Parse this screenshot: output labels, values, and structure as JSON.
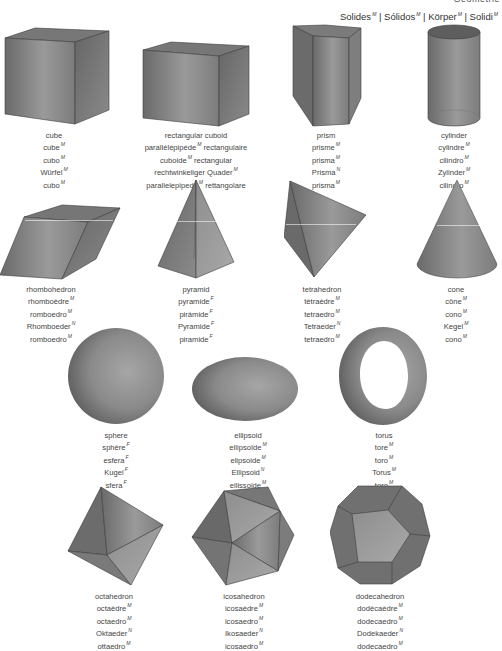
{
  "header": {
    "clipped_text": "Geometrie",
    "section_title": [
      {
        "word": "Solides",
        "gender": "M"
      },
      {
        "word": "Sólidos",
        "gender": "M"
      },
      {
        "word": "Körper",
        "gender": "M"
      },
      {
        "word": "Solidi",
        "gender": "M"
      }
    ],
    "separator": "|"
  },
  "colors": {
    "shape_fill_dark": "#6e6e6e",
    "shape_fill_light": "#a9a9a9",
    "edge": "#3c3c3c",
    "text": "#444444"
  },
  "solids": [
    {
      "id": "cube",
      "icon": "cube-icon",
      "names": [
        {
          "t": "cube",
          "g": ""
        },
        {
          "t": "cube",
          "g": "M"
        },
        {
          "t": "cubo",
          "g": "M"
        },
        {
          "t": "Würfel",
          "g": "M"
        },
        {
          "t": "cubo",
          "g": "M"
        }
      ]
    },
    {
      "id": "rectangular-cuboid",
      "icon": "cuboid-icon",
      "names": [
        {
          "t": "rectangular cuboid",
          "g": ""
        },
        {
          "t": "parallélépipède",
          "g": "M",
          "tail": " rectangulaire"
        },
        {
          "t": "cuboide",
          "g": "M",
          "tail": " rectangular"
        },
        {
          "t": "rechtwinkeliger Quader",
          "g": "M"
        },
        {
          "t": "parallelepipedo",
          "g": "M",
          "tail": " rettangolare"
        }
      ]
    },
    {
      "id": "prism",
      "icon": "prism-icon",
      "names": [
        {
          "t": "prism",
          "g": ""
        },
        {
          "t": "prisme",
          "g": "M"
        },
        {
          "t": "prisma",
          "g": "M"
        },
        {
          "t": "Prisma",
          "g": "N"
        },
        {
          "t": "prisma",
          "g": "M"
        }
      ]
    },
    {
      "id": "cylinder",
      "icon": "cylinder-icon",
      "names": [
        {
          "t": "cylinder",
          "g": ""
        },
        {
          "t": "cylindre",
          "g": "M"
        },
        {
          "t": "cilindro",
          "g": "M"
        },
        {
          "t": "Zylinder",
          "g": "M"
        },
        {
          "t": "cilindro",
          "g": "M"
        }
      ]
    },
    {
      "id": "rhombohedron",
      "icon": "rhombohedron-icon",
      "names": [
        {
          "t": "rhombohedron",
          "g": ""
        },
        {
          "t": "rhomboèdre",
          "g": "M"
        },
        {
          "t": "romboedro",
          "g": "M"
        },
        {
          "t": "Rhomboeder",
          "g": "N"
        },
        {
          "t": "romboedro",
          "g": "M"
        }
      ]
    },
    {
      "id": "pyramid",
      "icon": "pyramid-icon",
      "names": [
        {
          "t": "pyramid",
          "g": ""
        },
        {
          "t": "pyramide",
          "g": "F"
        },
        {
          "t": "pirámide",
          "g": "F"
        },
        {
          "t": "Pyramide",
          "g": "F"
        },
        {
          "t": "piramide",
          "g": "F"
        }
      ]
    },
    {
      "id": "tetrahedron",
      "icon": "tetrahedron-icon",
      "names": [
        {
          "t": "tetrahedron",
          "g": ""
        },
        {
          "t": "tétraèdre",
          "g": "M"
        },
        {
          "t": "tetraedro",
          "g": "M"
        },
        {
          "t": "Tetraeder",
          "g": "N"
        },
        {
          "t": "tetraedro",
          "g": "M"
        }
      ]
    },
    {
      "id": "cone",
      "icon": "cone-icon",
      "names": [
        {
          "t": "cone",
          "g": ""
        },
        {
          "t": "cône",
          "g": "M"
        },
        {
          "t": "cono",
          "g": "M"
        },
        {
          "t": "Kegel",
          "g": "M"
        },
        {
          "t": "cono",
          "g": "M"
        }
      ]
    },
    {
      "id": "sphere",
      "icon": "sphere-icon",
      "names": [
        {
          "t": "sphere",
          "g": ""
        },
        {
          "t": "sphère",
          "g": "F"
        },
        {
          "t": "esfera",
          "g": "F"
        },
        {
          "t": "Kugel",
          "g": "F"
        },
        {
          "t": "sfera",
          "g": "F"
        }
      ]
    },
    {
      "id": "ellipsoid",
      "icon": "ellipsoid-icon",
      "names": [
        {
          "t": "ellipsoid",
          "g": ""
        },
        {
          "t": "ellipsoïde",
          "g": "M"
        },
        {
          "t": "elipsoide",
          "g": "M"
        },
        {
          "t": "Ellipsoid",
          "g": "N"
        },
        {
          "t": "ellissoide",
          "g": "M"
        }
      ]
    },
    {
      "id": "torus",
      "icon": "torus-icon",
      "names": [
        {
          "t": "torus",
          "g": ""
        },
        {
          "t": "tore",
          "g": "M"
        },
        {
          "t": "toro",
          "g": "M"
        },
        {
          "t": "Torus",
          "g": "M"
        },
        {
          "t": "toro",
          "g": "M"
        }
      ]
    },
    {
      "id": "octahedron",
      "icon": "octahedron-icon",
      "names": [
        {
          "t": "octahedron",
          "g": ""
        },
        {
          "t": "octaèdre",
          "g": "M"
        },
        {
          "t": "octaedro",
          "g": "M"
        },
        {
          "t": "Oktaeder",
          "g": "N"
        },
        {
          "t": "ottaedro",
          "g": "M"
        }
      ]
    },
    {
      "id": "icosahedron",
      "icon": "icosahedron-icon",
      "names": [
        {
          "t": "icosahedron",
          "g": ""
        },
        {
          "t": "icosaèdre",
          "g": "M"
        },
        {
          "t": "icosaedro",
          "g": "M"
        },
        {
          "t": "Ikosaeder",
          "g": "N"
        },
        {
          "t": "icosaedro",
          "g": "M"
        }
      ]
    },
    {
      "id": "dodecahedron",
      "icon": "dodecahedron-icon",
      "names": [
        {
          "t": "dodecahedron",
          "g": ""
        },
        {
          "t": "dodécaèdre",
          "g": "M"
        },
        {
          "t": "dodecaedro",
          "g": "M"
        },
        {
          "t": "Dodekaeder",
          "g": "N"
        },
        {
          "t": "dodecaedro",
          "g": "M"
        }
      ]
    }
  ]
}
